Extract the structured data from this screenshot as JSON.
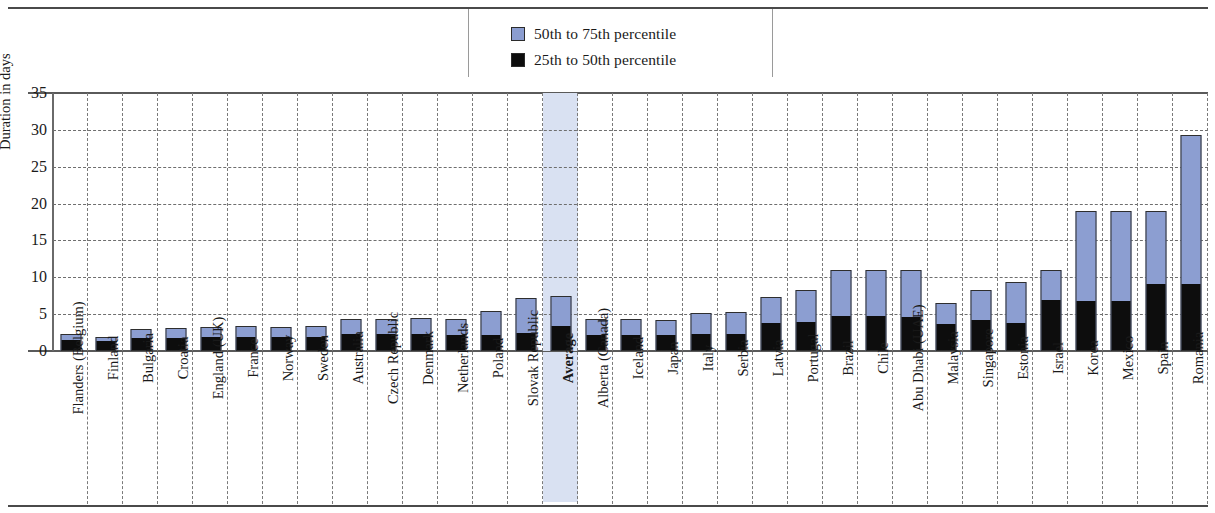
{
  "legend": {
    "items": [
      {
        "label": "50th to 75th percentile",
        "color": "#8c9ed1",
        "icon": "blue-square-swatch"
      },
      {
        "label": "25th to 50th percentile",
        "color": "#0d0d0d",
        "icon": "black-square-swatch"
      }
    ]
  },
  "chart_data": {
    "type": "bar",
    "title": "",
    "xlabel": "",
    "ylabel": "Duration in days",
    "ylim": [
      0,
      35
    ],
    "yticks": [
      0,
      5,
      10,
      15,
      20,
      25,
      30,
      35
    ],
    "grid": true,
    "legend_position": "top-center",
    "stacked": true,
    "highlight_category": "Average",
    "highlight_color": "#d9e1f2",
    "categories": [
      "Flanders (Belgium)",
      "Finland",
      "Bulgaria",
      "Croatia",
      "England (UK)",
      "France",
      "Norway",
      "Sweden",
      "Australia",
      "Czech Republic",
      "Denmark",
      "Netherlands",
      "Poland",
      "Slovak Republic",
      "Average",
      "Alberta (Canada)",
      "Iceland",
      "Japan",
      "Italy",
      "Serbia",
      "Latvia",
      "Portugal",
      "Brazil",
      "Chile",
      "Abu Dhabi (UAE)",
      "Malaysia",
      "Singapore",
      "Estonia",
      "Israel",
      "Korea",
      "Mexico",
      "Spain",
      "Romania"
    ],
    "series": [
      {
        "name": "25th to 50th percentile",
        "color": "#0d0d0d",
        "values": [
          1.4,
          1.2,
          1.6,
          1.6,
          1.7,
          1.8,
          1.8,
          1.8,
          2.2,
          2.2,
          2.2,
          2.0,
          2.1,
          2.3,
          3.3,
          2.1,
          2.0,
          2.0,
          2.2,
          2.2,
          3.6,
          3.8,
          4.6,
          4.6,
          4.5,
          3.5,
          4.1,
          3.6,
          6.8,
          6.7,
          6.7,
          9.0,
          9.0
        ]
      },
      {
        "name": "50th to 75th percentile",
        "color": "#8c9ed1",
        "values": [
          0.9,
          0.7,
          1.4,
          1.5,
          1.6,
          1.6,
          1.4,
          1.6,
          2.2,
          2.2,
          2.3,
          2.3,
          3.3,
          4.9,
          4.2,
          2.3,
          2.3,
          2.2,
          3.0,
          3.1,
          3.7,
          4.5,
          6.4,
          6.4,
          6.5,
          3.0,
          4.2,
          5.7,
          4.2,
          12.3,
          12.3,
          10.0,
          20.3
        ]
      }
    ],
    "totals": [
      2.3,
      1.9,
      3.0,
      3.1,
      3.3,
      3.4,
      3.2,
      3.4,
      4.4,
      4.4,
      4.5,
      4.3,
      5.4,
      7.2,
      7.5,
      4.4,
      4.3,
      4.2,
      5.2,
      5.3,
      7.3,
      8.3,
      11.0,
      11.0,
      11.0,
      6.5,
      8.3,
      9.3,
      11.0,
      19.0,
      19.0,
      19.0,
      29.3
    ]
  }
}
